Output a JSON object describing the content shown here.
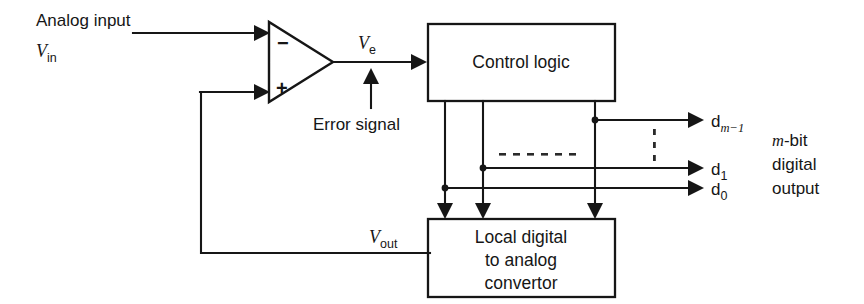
{
  "diagram": {
    "ink_color": "#161616",
    "background": "#ffffff"
  },
  "labels": {
    "analog_input": "Analog input",
    "vin_base": "V",
    "vin_sub": "in",
    "ve_base": "V",
    "ve_sub": "e",
    "error_signal": "Error signal",
    "vout_base": "V",
    "vout_sub": "out",
    "minus_sign": "−",
    "plus_sign": "+"
  },
  "blocks": {
    "control_logic": {
      "label": "Control logic"
    },
    "dac": {
      "line1": "Local digital",
      "line2": "to analog",
      "line3": "convertor"
    }
  },
  "outputs": {
    "bits": [
      {
        "base": "d",
        "sub": "m−1",
        "sub_italic": true
      },
      {
        "base": "d",
        "sub": "1",
        "sub_italic": false
      },
      {
        "base": "d",
        "sub": "0",
        "sub_italic": false
      }
    ],
    "caption": {
      "line1_italic": "m",
      "line1_rest": "-bit",
      "line2": "digital",
      "line3": "output"
    }
  },
  "icons": {
    "comparator": "comparator-triangle-icon",
    "arrow": "arrowhead-icon",
    "junction": "junction-dot-icon",
    "ellipsis_h": "horizontal-ellipsis-icon",
    "ellipsis_v": "vertical-ellipsis-icon"
  }
}
